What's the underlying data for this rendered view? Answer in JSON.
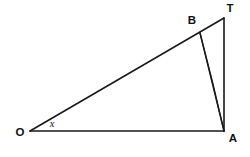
{
  "figure": {
    "type": "geometry-diagram",
    "background_color": "#ffffff",
    "stroke_color": "#1a1a1a",
    "label_color": "#111111",
    "width": 250,
    "height": 157
  },
  "points": {
    "O": {
      "label": "O",
      "x": 30,
      "y": 131,
      "label_x": 20,
      "label_y": 133
    },
    "A": {
      "label": "A",
      "x": 224,
      "y": 131,
      "label_x": 233,
      "label_y": 139
    },
    "T": {
      "label": "T",
      "x": 224,
      "y": 18,
      "label_x": 230,
      "label_y": 9
    },
    "B": {
      "label": "B",
      "x": 200,
      "y": 33,
      "label_x": 192,
      "label_y": 21
    }
  },
  "angles": {
    "at_O": {
      "label": "x",
      "label_x": 52,
      "label_y": 125
    }
  },
  "segments": [
    {
      "name": "O-to-T",
      "from": "O",
      "to": "T",
      "width": 1.6
    },
    {
      "name": "O-to-A",
      "from": "O",
      "to": "A",
      "width": 1.6
    },
    {
      "name": "T-to-A",
      "from": "T",
      "to": "A",
      "width": 1.6
    },
    {
      "name": "B-to-A",
      "from": "B",
      "to": "A",
      "width": 1.4
    }
  ],
  "arcs": [
    {
      "name": "arc-B-to-A",
      "from": "B",
      "to": "A",
      "path": "M 200 33 Q 213 82 224 131",
      "width": 1.3
    }
  ]
}
